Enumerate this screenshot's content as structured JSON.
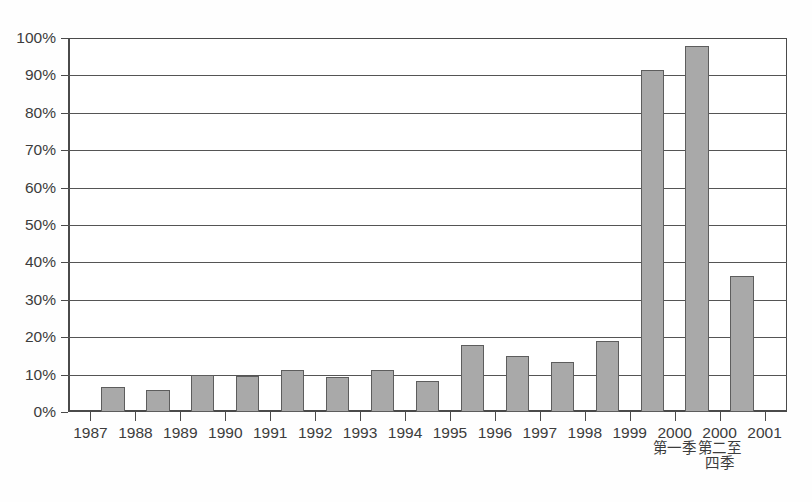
{
  "chart_data": {
    "type": "bar",
    "title": "",
    "subtitle": "",
    "xlabel": "",
    "ylabel": "",
    "ylim": [
      0,
      100
    ],
    "yticks": [
      "0%",
      "10%",
      "20%",
      "30%",
      "40%",
      "50%",
      "60%",
      "70%",
      "80%",
      "90%",
      "100%"
    ],
    "ytick_values": [
      0,
      10,
      20,
      30,
      40,
      50,
      60,
      70,
      80,
      90,
      100
    ],
    "grid": true,
    "legend": "none",
    "categories": [
      "1987",
      "1988",
      "1989",
      "1990",
      "1991",
      "1992",
      "1993",
      "1994",
      "1995",
      "1996",
      "1997",
      "1998",
      "1999",
      "2000",
      "2000",
      "2001"
    ],
    "category_sublabels": [
      "",
      "",
      "",
      "",
      "",
      "",
      "",
      "",
      "",
      "",
      "",
      "",
      "",
      "第一季",
      "第二至",
      ""
    ],
    "category_sublabels2": [
      "",
      "",
      "",
      "",
      "",
      "",
      "",
      "",
      "",
      "",
      "",
      "",
      "",
      "",
      "四季",
      ""
    ],
    "values": [
      6.7,
      6.0,
      10.0,
      9.5,
      11.3,
      9.4,
      11.2,
      8.2,
      18.0,
      15.0,
      13.5,
      19.0,
      91.5,
      97.8,
      36.5,
      10.5
    ],
    "bar_color": "#a9a9a9",
    "bar_border_color": "#5d5d5d",
    "axis_color": "#4a4a4a",
    "grid_color": "#555555",
    "background": "#ffffff",
    "bar_count": 15,
    "note_bar_count": "15 plotted bars; x axis shows 16 tick labels"
  }
}
